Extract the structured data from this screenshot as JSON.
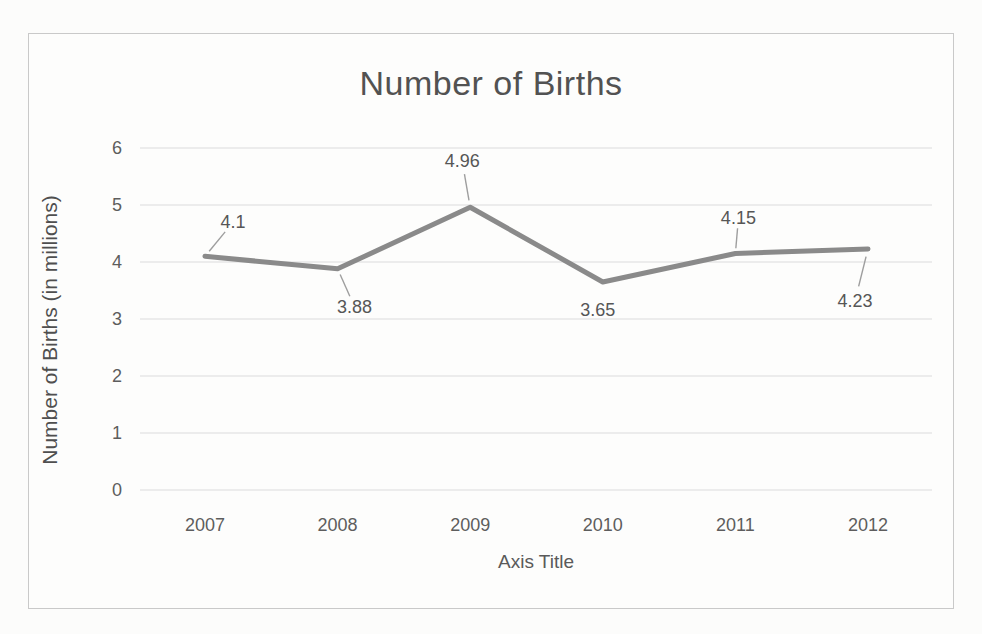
{
  "chart_data": {
    "type": "line",
    "title": "Number of Births",
    "xlabel": "Axis Title",
    "ylabel": "Number of Births (in millions)",
    "categories": [
      "2007",
      "2008",
      "2009",
      "2010",
      "2011",
      "2012"
    ],
    "values": [
      4.1,
      3.88,
      4.96,
      3.65,
      4.15,
      4.23
    ],
    "data_labels": [
      "4.1",
      "3.88",
      "4.96",
      "3.65",
      "4.15",
      "4.23"
    ],
    "yticks": [
      "0",
      "1",
      "2",
      "3",
      "4",
      "5",
      "6"
    ],
    "ylim": [
      0,
      6
    ],
    "grid": true,
    "legend_position": "none",
    "series_name": "Number of Births",
    "colors": {
      "line": "#8a8a8a",
      "leader_line": "#9e9e9e",
      "gridline": "#dcdcdc",
      "frame_border": "#c9c9c9",
      "text": "#565656",
      "background": "#fcfcfb"
    }
  }
}
